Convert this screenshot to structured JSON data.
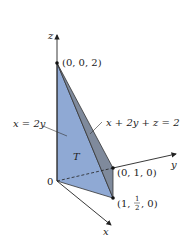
{
  "diagram": {
    "axes": {
      "z_label": "z",
      "y_label": "y",
      "x_label": "x",
      "origin_label": "0"
    },
    "points": {
      "top": "(0, 0, 2)",
      "y_point": "(0, 1, 0)",
      "x_point_prefix": "(1, ",
      "x_point_num": "1",
      "x_point_den": "2",
      "x_point_suffix": ", 0)"
    },
    "labels": {
      "plane_left": "x = 2y",
      "plane_right": "x + 2y + z = 2",
      "region": "T"
    },
    "colors": {
      "front_face": "#8fa9d4",
      "side_face": "#7f8a9c",
      "edge": "#333333"
    }
  }
}
